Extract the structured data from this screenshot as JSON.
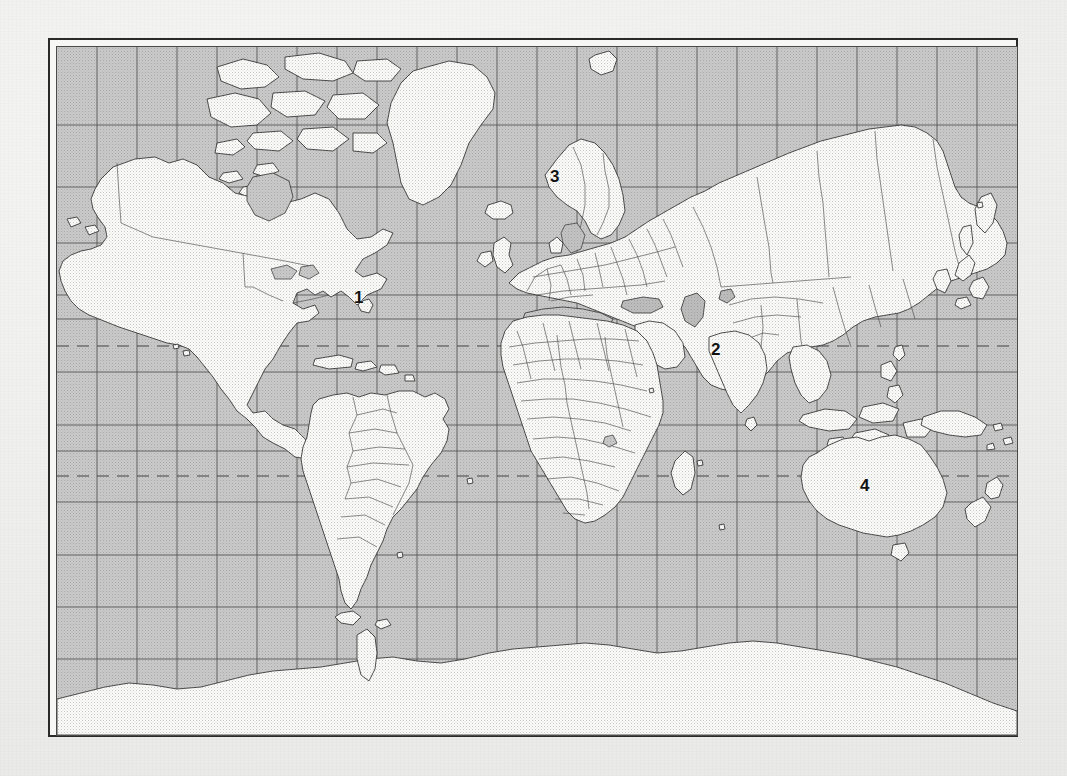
{
  "document": {
    "type": "map-worksheet",
    "paper_color": "#f1f1f0",
    "frame_color": "#2a2a2a",
    "ocean_color": "#c9c9c9",
    "land_color": "#fbfbfa",
    "coastline_color": "#2b2b2b",
    "grid_color": "#4e4e4e",
    "bleed_through": [
      "",
      "",
      "",
      "",
      "",
      ""
    ]
  },
  "map": {
    "projection_note": "Mercator, world, grid of meridians and parallels",
    "grid": {
      "visible": true,
      "meridian_spacing_degrees": 15,
      "parallel_spacing_degrees": 15,
      "vertical_lines": 24,
      "horizontal_lines": 13
    },
    "dashed_lines": [
      {
        "name": "tropic-of-cancer",
        "y": 299
      },
      {
        "name": "tropic-of-capricorn",
        "y": 429
      }
    ],
    "labels": [
      {
        "id": "label-1",
        "text": "1",
        "x": 297,
        "y": 242,
        "feature": "north-atlantic-ocean"
      },
      {
        "id": "label-2",
        "text": "2",
        "x": 654,
        "y": 294,
        "feature": "india"
      },
      {
        "id": "label-3",
        "text": "3",
        "x": 493,
        "y": 121,
        "feature": "sweden"
      },
      {
        "id": "label-4",
        "text": "4",
        "x": 803,
        "y": 430,
        "feature": "australia"
      }
    ]
  }
}
